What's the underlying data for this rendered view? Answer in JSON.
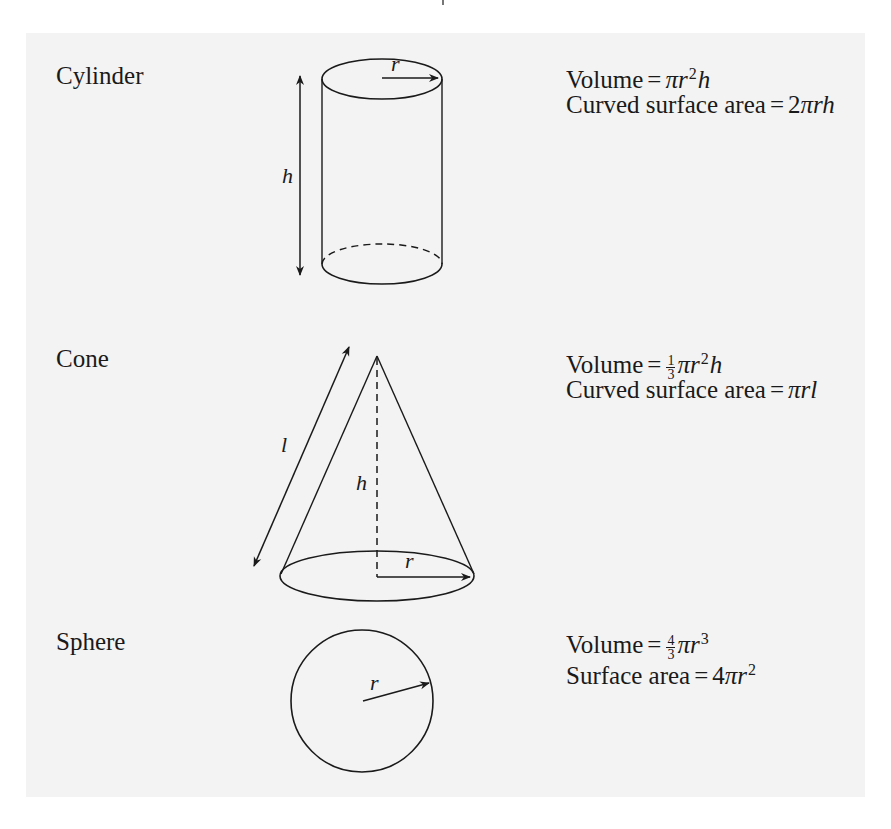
{
  "figure": {
    "background_color": "#f3f3f3",
    "line_color": "#1a1a1a",
    "shapes": [
      {
        "name": "Cylinder",
        "labels": {
          "radius": "r",
          "height": "h"
        },
        "formulas": {
          "volume_label": "Volume",
          "volume_expr": "πr²h",
          "area_label": "Curved surface area",
          "area_expr": "2πrh"
        }
      },
      {
        "name": "Cone",
        "labels": {
          "radius": "r",
          "height": "h",
          "slant": "l"
        },
        "formulas": {
          "volume_label": "Volume",
          "volume_frac_num": "1",
          "volume_frac_den": "3",
          "volume_expr": "πr²h",
          "area_label": "Curved surface area",
          "area_expr": "πrl"
        }
      },
      {
        "name": "Sphere",
        "labels": {
          "radius": "r"
        },
        "formulas": {
          "volume_label": "Volume",
          "volume_frac_num": "4",
          "volume_frac_den": "3",
          "volume_expr": "πr³",
          "area_label": "Surface area",
          "area_expr": "4πr²"
        }
      }
    ]
  }
}
